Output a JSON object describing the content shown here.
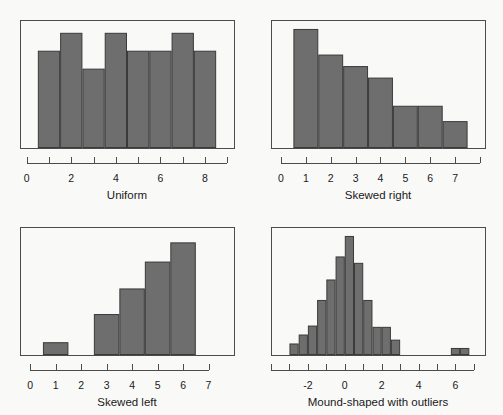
{
  "figure": {
    "background_color": "#f9f9f8",
    "bar_fill_color": "#6e6e6e",
    "bar_edge_color": "#3a3a3a",
    "axis_color": "#4c4c4c",
    "frame_color": "#4c4c4c"
  },
  "chart_data": [
    {
      "type": "bar",
      "title": "Uniform",
      "xlabel": "Uniform",
      "ylabel": "",
      "grid": false,
      "legend": null,
      "xlim": [
        -0.3,
        9.3
      ],
      "ylim": [
        0,
        10
      ],
      "bin_width": 1,
      "bin_edges": [
        0.5,
        1.5,
        2.5,
        3.5,
        4.5,
        5.5,
        6.5,
        7.5,
        8.5
      ],
      "bin_centers": [
        1,
        2,
        3,
        4,
        5,
        6,
        7,
        8
      ],
      "values": [
        7.6,
        9,
        6.2,
        9,
        7.6,
        7.6,
        9,
        7.6
      ],
      "tick_values": [
        0,
        1,
        2,
        3,
        4,
        5,
        6,
        7,
        8,
        9
      ],
      "tick_labels": [
        "0",
        "",
        "2",
        "",
        "4",
        "",
        "6",
        "",
        "8",
        ""
      ],
      "labeled_ticks": [
        "0",
        "2",
        "4",
        "6",
        "8"
      ]
    },
    {
      "type": "bar",
      "title": "Skewed right",
      "xlabel": "Skewed right",
      "ylabel": "",
      "grid": false,
      "legend": null,
      "xlim": [
        -0.4,
        8.2
      ],
      "ylim": [
        0,
        10
      ],
      "bin_width": 1,
      "bin_edges": [
        0.5,
        1.5,
        2.5,
        3.5,
        4.5,
        5.5,
        6.5,
        7.5
      ],
      "bin_centers": [
        1,
        2,
        3,
        4,
        5,
        6,
        7
      ],
      "values": [
        9.3,
        7.3,
        6.4,
        5.5,
        3.3,
        3.3,
        2.1
      ],
      "tick_values": [
        0,
        1,
        2,
        3,
        4,
        5,
        6,
        7,
        8
      ],
      "tick_labels": [
        "0",
        "1",
        "2",
        "3",
        "4",
        "5",
        "6",
        "7",
        ""
      ],
      "labeled_ticks": [
        "0",
        "1",
        "2",
        "3",
        "4",
        "5",
        "6",
        "7"
      ]
    },
    {
      "type": "bar",
      "title": "Skewed left",
      "xlabel": "Skewed left",
      "ylabel": "",
      "grid": false,
      "legend": null,
      "xlim": [
        -0.4,
        8.0
      ],
      "ylim": [
        0,
        10
      ],
      "bin_width": 1,
      "bin_edges": [
        0.5,
        1.5,
        2.5,
        3.5,
        4.5,
        5.5,
        6.5
      ],
      "bin_centers": [
        1,
        2,
        3,
        4,
        5,
        6
      ],
      "values": [
        1.0,
        0,
        3.2,
        5.2,
        7.3,
        8.8
      ],
      "tick_values": [
        0,
        1,
        2,
        3,
        4,
        5,
        6,
        7
      ],
      "tick_labels": [
        "0",
        "1",
        "2",
        "3",
        "4",
        "5",
        "6",
        "7"
      ],
      "labeled_ticks": [
        "0",
        "1",
        "2",
        "3",
        "4",
        "5",
        "6",
        "7"
      ]
    },
    {
      "type": "bar",
      "title": "Mound-shaped with outliers",
      "xlabel": "Mound-shaped with outliers",
      "ylabel": "",
      "grid": false,
      "legend": null,
      "xlim": [
        -4.0,
        7.6
      ],
      "ylim": [
        0,
        10
      ],
      "bin_width": 0.5,
      "bin_edges": [
        -3.0,
        -2.5,
        -2.0,
        -1.5,
        -1.0,
        -0.5,
        0.0,
        0.5,
        1.0,
        1.5,
        2.0,
        2.5,
        3.0
      ],
      "bin_centers": [
        -2.75,
        -2.25,
        -1.75,
        -1.25,
        -0.75,
        -0.25,
        0.25,
        0.75,
        1.25,
        1.75,
        2.25,
        2.75
      ],
      "values": [
        0.9,
        1.6,
        2.3,
        4.3,
        5.9,
        7.7,
        9.3,
        7.2,
        4.3,
        2.2,
        2.2,
        1.2
      ],
      "outlier_bin_edges": [
        5.75,
        6.25,
        6.75
      ],
      "outlier_bin_centers": [
        6.0,
        6.5
      ],
      "outlier_values": [
        0.55,
        0.55
      ],
      "tick_values": [
        -4,
        -3,
        -2,
        -1,
        0,
        1,
        2,
        3,
        4,
        5,
        6,
        7
      ],
      "tick_labels": [
        "",
        "",
        "-2",
        "",
        "0",
        "",
        "2",
        "",
        "4",
        "",
        "6",
        ""
      ],
      "labeled_ticks": [
        "-2",
        "0",
        "2",
        "4",
        "6"
      ]
    }
  ]
}
